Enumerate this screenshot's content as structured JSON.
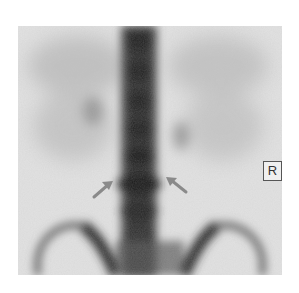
{
  "figure": {
    "type": "bone-scintigraphy",
    "view": "posterior",
    "marker_label": "R",
    "arrows": [
      {
        "name": "left-arrow",
        "from": [
          94,
          197
        ],
        "to": [
          112,
          182
        ]
      },
      {
        "name": "right-arrow",
        "from": [
          186,
          192
        ],
        "to": [
          166,
          178
        ]
      }
    ],
    "colors": {
      "background": "#ffffff",
      "scan_background": "#e2e2e2",
      "uptake_dark": "#1e1e1e",
      "arrow": "#8a8a8a"
    }
  }
}
